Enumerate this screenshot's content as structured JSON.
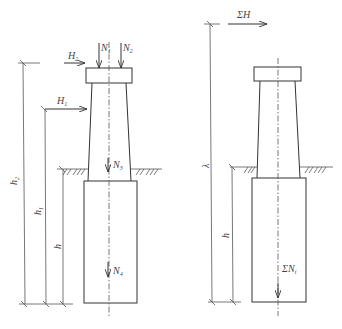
{
  "figure": {
    "left_diagram": {
      "labels": {
        "H2": "H",
        "H2_sub": "2",
        "H1": "H",
        "H1_sub": "1",
        "N1": "N",
        "N1_sub": "1",
        "N2": "N",
        "N2_sub": "2",
        "N3": "N",
        "N3_sub": "3",
        "N4": "N",
        "N4_sub": "4",
        "h2": "h",
        "h2_sub": "2",
        "h1": "h",
        "h1_sub": "1",
        "h": "h"
      }
    },
    "right_diagram": {
      "labels": {
        "sumH": "ΣH",
        "sumN": "ΣN",
        "sumN_sub": "i",
        "lambda": "λ",
        "h": "h"
      }
    },
    "colors": {
      "line": "#333333",
      "text": "#444444",
      "background": "#ffffff"
    }
  }
}
